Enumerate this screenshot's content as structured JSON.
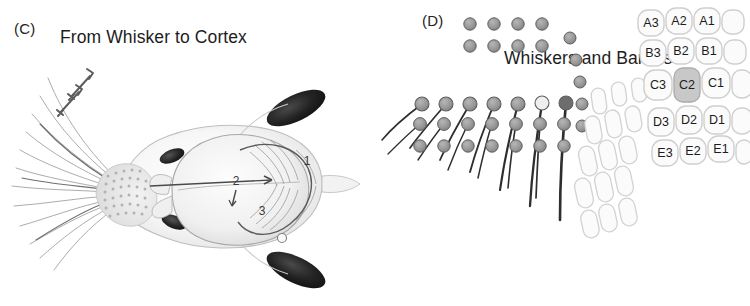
{
  "figure": {
    "background": "#ffffff",
    "panels": [
      {
        "label": "(C)",
        "title": "From Whisker to Cortex"
      },
      {
        "label": "(D)",
        "title": "Whiskers and Barrels"
      }
    ]
  },
  "panel_c": {
    "label": "(C)",
    "title": "From Whisker to Cortex",
    "subject": "dorsal view of mouse head with whisker pad, eyes, ears and brain",
    "pathway_annotations": [
      {
        "id": "1",
        "x": 307,
        "y": 162
      },
      {
        "id": "2",
        "x": 236,
        "y": 182
      },
      {
        "id": "3",
        "x": 262,
        "y": 212
      }
    ],
    "motion_arrows": 2,
    "colors": {
      "body_outline": "#b9b9b9",
      "body_fill": "#f6f6f6",
      "eye": "#2a2a2a",
      "ear": "#1e1e1e",
      "brain_outline": "#9a9a9a",
      "whisker": "#8a8a8a",
      "arrow": "#5a5a5a",
      "pathway": "#4a4a4a"
    }
  },
  "panel_d": {
    "label": "(D)",
    "title": "Whiskers and Barrels",
    "whisker_pad": {
      "caption": "whisker follicle array with emerging whiskers",
      "rows": 5,
      "columns": 7,
      "arc_dots": 5,
      "colors": {
        "follicle_fill": "#9a9a9a",
        "follicle_stroke": "#5e5e5e",
        "whisker": "#2e2e2e"
      }
    },
    "barrel_field": {
      "caption": "somatosensory barrel cortex map",
      "highlighted_barrel": "C2",
      "rows": [
        {
          "row": "A",
          "labels": [
            "A3",
            "A2",
            "A1"
          ]
        },
        {
          "row": "B",
          "labels": [
            "B3",
            "B2",
            "B1"
          ]
        },
        {
          "row": "C",
          "labels": [
            "C3",
            "C2",
            "C1"
          ]
        },
        {
          "row": "D",
          "labels": [
            "D3",
            "D2",
            "D1"
          ]
        },
        {
          "row": "E",
          "labels": [
            "E3",
            "E2",
            "E1"
          ]
        }
      ],
      "colors": {
        "barrel_stroke": "#cfcfcf",
        "barrel_fill": "#fbfbfb",
        "highlight_fill": "#c8c8c8",
        "highlight_stroke": "#ababab",
        "label_text": "#1c1c1c"
      }
    }
  }
}
